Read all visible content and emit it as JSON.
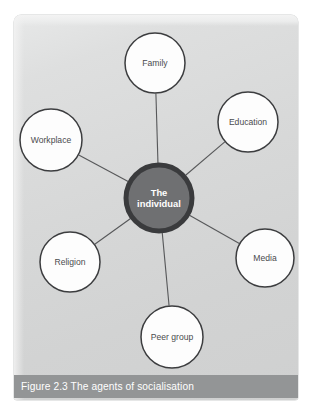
{
  "figure": {
    "caption": "Figure 2.3 The agents of socialisation",
    "panel_background_color": "#d7d8d8",
    "caption_band_color": "#939596",
    "caption_text_color": "#ffffff"
  },
  "chart_data": {
    "type": "diagram",
    "diagram_kind": "hub-and-spoke",
    "title": "Figure 2.3 The agents of socialisation",
    "hub": {
      "label_line_1": "The",
      "label_line_2": "individual",
      "label": "The individual",
      "cx": 159,
      "cy": 198,
      "r": 33,
      "fill": "#6f7072",
      "ring_color": "#3a3b3d",
      "text_color": "#ffffff"
    },
    "nodes": [
      {
        "id": "family",
        "label": "Family",
        "cx": 155,
        "cy": 63,
        "r": 30,
        "fill": "#fdfdfd",
        "stroke": "#3c3d3f"
      },
      {
        "id": "education",
        "label": "Education",
        "cx": 248,
        "cy": 122,
        "r": 30,
        "fill": "#fdfdfd",
        "stroke": "#3c3d3f"
      },
      {
        "id": "media",
        "label": "Media",
        "cx": 265,
        "cy": 258,
        "r": 29,
        "fill": "#fdfdfd",
        "stroke": "#3c3d3f"
      },
      {
        "id": "peer-group",
        "label": "Peer group",
        "cx": 172,
        "cy": 337,
        "r": 31,
        "fill": "#fdfdfd",
        "stroke": "#3c3d3f"
      },
      {
        "id": "religion",
        "label": "Religion",
        "cx": 70,
        "cy": 262,
        "r": 30,
        "fill": "#fdfdfd",
        "stroke": "#3c3d3f"
      },
      {
        "id": "workplace",
        "label": "Workplace",
        "cx": 51,
        "cy": 140,
        "r": 31,
        "fill": "#fdfdfd",
        "stroke": "#3c3d3f"
      }
    ],
    "edges": [
      {
        "from": "hub",
        "to": "family"
      },
      {
        "from": "hub",
        "to": "education"
      },
      {
        "from": "hub",
        "to": "media"
      },
      {
        "from": "hub",
        "to": "peer-group"
      },
      {
        "from": "hub",
        "to": "religion"
      },
      {
        "from": "hub",
        "to": "workplace"
      }
    ],
    "edge_color": "#57585a",
    "legend": null,
    "grid": false
  }
}
